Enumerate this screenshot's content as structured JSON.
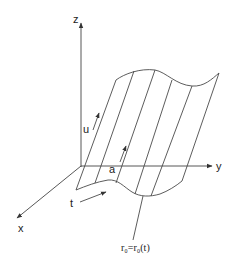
{
  "diagram": {
    "type": "ruled-surface",
    "axes": {
      "z": {
        "label": "z"
      },
      "y": {
        "label": "y"
      },
      "x": {
        "label": "x"
      }
    },
    "labels": {
      "u": "u",
      "a": "a",
      "t": "t",
      "directrix": "r₀=r₀(t)"
    },
    "colors": {
      "line": "#4a4a4a",
      "text": "#222222",
      "background": "#ffffff"
    }
  }
}
